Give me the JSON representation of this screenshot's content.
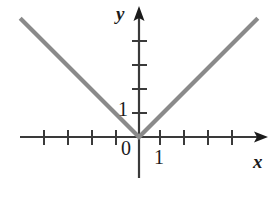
{
  "figure": {
    "background_color": "#ffffff"
  },
  "labels": {
    "x_axis": "x",
    "y_axis": "y",
    "origin": "0",
    "x_unit": "1",
    "y_unit": "1"
  },
  "colors": {
    "curve": "#8a8a8a",
    "axis": "#3a3a3a",
    "text": "#1b1b1b"
  },
  "chart_data": {
    "type": "line",
    "title": "",
    "xlabel": "x",
    "ylabel": "y",
    "grid": false,
    "legend": false,
    "xlim": [
      -5,
      5.5
    ],
    "ylim": [
      -1.5,
      5.3
    ],
    "xticks": [
      -4,
      -3,
      -2,
      -1,
      1,
      2,
      3,
      4
    ],
    "yticks": [
      1,
      2,
      3,
      4
    ],
    "xtick_labels": [
      "",
      "",
      "",
      "",
      "1",
      "",
      "",
      ""
    ],
    "ytick_labels": [
      "1",
      "",
      "",
      ""
    ],
    "annotations": [
      {
        "text": "0",
        "x": -0.45,
        "y": -0.45
      },
      {
        "text": "1",
        "x": -0.6,
        "y": 1.2
      },
      {
        "text": "1",
        "x": 0.75,
        "y": -0.7
      }
    ],
    "series": [
      {
        "name": "y = |x|",
        "x": [
          -4.95,
          0,
          4.95
        ],
        "values": [
          4.95,
          0,
          4.95
        ]
      }
    ]
  }
}
